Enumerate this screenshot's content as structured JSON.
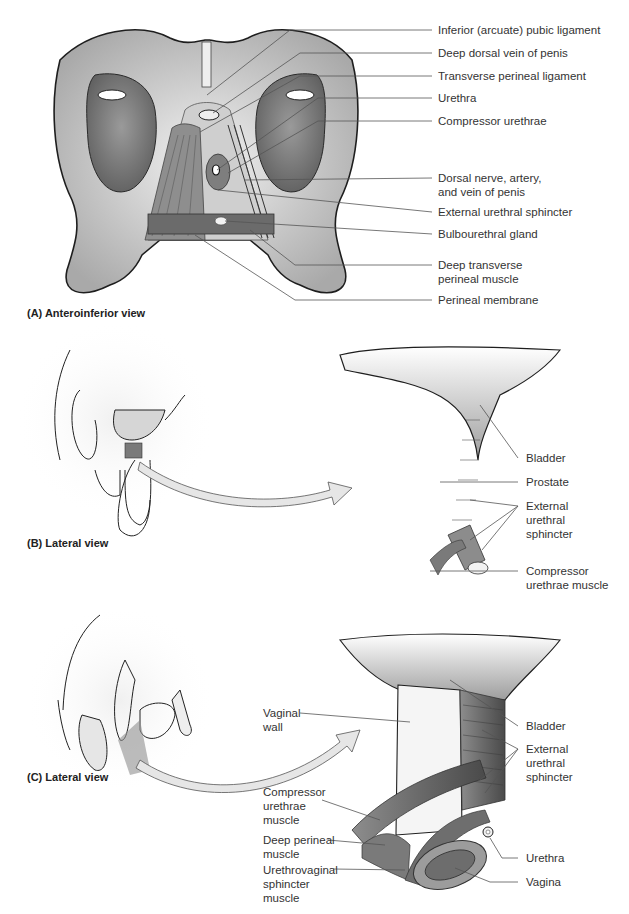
{
  "figure": {
    "panels": [
      {
        "id": "A",
        "caption": "(A) Anteroinferior view",
        "labels": [
          "Inferior (arcuate) pubic ligament",
          "Deep dorsal vein of penis",
          "Transverse perineal ligament",
          "Urethra",
          "Compressor urethrae",
          "Dorsal nerve, artery,\nand vein of penis",
          "External urethral sphincter",
          "Bulbourethral gland",
          "Deep transverse\nperineal muscle",
          "Perineal membrane"
        ]
      },
      {
        "id": "B",
        "caption": "(B) Lateral view",
        "labels": [
          "Bladder",
          "Prostate",
          "External\nurethral\nsphincter",
          "Compressor\nurethrae muscle"
        ]
      },
      {
        "id": "C",
        "caption": "(C) Lateral view",
        "labels_right": [
          "Bladder",
          "External\nurethral\nsphincter",
          "Urethra",
          "Vagina"
        ],
        "labels_left": [
          "Vaginal\nwall",
          "Compressor\nurethrae\nmuscle",
          "Deep perineal\nmuscle",
          "Urethrovaginal\nsphincter\nmuscle"
        ]
      }
    ]
  },
  "colors": {
    "bone": "#d9d9d9",
    "bone_shadow": "#8a8a8a",
    "muscle": "#7a7a7a",
    "muscle_dark": "#555555",
    "outline": "#1e1e1e",
    "leader_line": "#555555",
    "arrow_fill": "#e6e6e6"
  }
}
